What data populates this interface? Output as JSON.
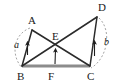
{
  "figure": {
    "background_color": "#ffffff",
    "stroke_color": "#2b2b2b",
    "base_color": "#8c8c8c",
    "arc_color": "#9a9a9a",
    "label_color": "#1a1a1a",
    "points": {
      "A": {
        "label": "A",
        "x": 32,
        "y": 30,
        "label_x": 28,
        "label_y": 24
      },
      "D": {
        "label": "D",
        "x": 97,
        "y": 17,
        "label_x": 98,
        "label_y": 11
      },
      "B": {
        "label": "B",
        "x": 22,
        "y": 66,
        "label_x": 17,
        "label_y": 80
      },
      "C": {
        "label": "C",
        "x": 90,
        "y": 66,
        "label_x": 87,
        "label_y": 80
      },
      "E": {
        "label": "E",
        "x": 57,
        "y": 44,
        "label_x": 52,
        "label_y": 40
      },
      "F": {
        "label": "F",
        "x": 52,
        "y": 66,
        "label_x": 48,
        "label_y": 80
      }
    },
    "segments": [
      {
        "name": "segment-AB",
        "from": "A",
        "to": "B",
        "style": "solid"
      },
      {
        "name": "segment-AC",
        "from": "A",
        "to": "C",
        "style": "solid"
      },
      {
        "name": "segment-BD",
        "from": "B",
        "to": "D",
        "style": "solid"
      },
      {
        "name": "segment-DC",
        "from": "D",
        "to": "C",
        "style": "solid"
      },
      {
        "name": "segment-BC",
        "from": "B",
        "to": "C",
        "style": "thick-gray"
      }
    ],
    "side_labels": [
      {
        "name": "side-label-a",
        "text": "a",
        "x": 14,
        "y": 48,
        "for_segment": "segment-AB"
      },
      {
        "name": "side-label-b",
        "text": "b",
        "x": 104,
        "y": 45,
        "for_segment": "segment-DC"
      }
    ],
    "arcs": [
      {
        "name": "arc-left",
        "d": "M 30 28 C 14 34 10 54 22 68",
        "side": "left"
      },
      {
        "name": "arc-right",
        "d": "M 99 18 C 112 30 108 58 91 68",
        "side": "right"
      }
    ],
    "tick_arrows": [
      {
        "name": "tick-arrow-ab",
        "x1": 27.5,
        "y1": 55,
        "x2": 27.5,
        "y2": 43,
        "note": "arrow on side AB"
      },
      {
        "name": "tick-arrow-dc",
        "x1": 94.5,
        "y1": 56,
        "x2": 94.5,
        "y2": 42,
        "note": "arrow on side DC"
      },
      {
        "name": "tick-arrow-fe",
        "x1": 55,
        "y1": 64,
        "x2": 55.5,
        "y2": 50,
        "note": "arrow from F toward E"
      }
    ]
  }
}
